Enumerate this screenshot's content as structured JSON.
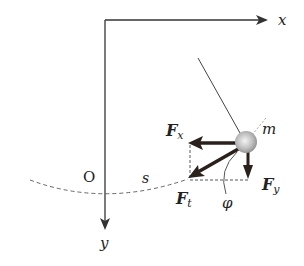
{
  "diagram": {
    "axes": {
      "x_label": "x",
      "y_label": "y",
      "origin_label": "O"
    },
    "arc_label": "s",
    "mass_label": "m",
    "forces": {
      "fx": {
        "main": "F",
        "sub": "x"
      },
      "fy": {
        "main": "F",
        "sub": "y"
      },
      "ft": {
        "main": "F",
        "sub": "t"
      }
    },
    "angle_label": "φ",
    "colors": {
      "line": "#333333",
      "force_arrow": "#2a201c",
      "ball": "#bbbbbb"
    }
  }
}
